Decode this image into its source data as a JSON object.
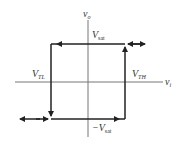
{
  "diagram": {
    "axes": {
      "vertical": {
        "var": "v",
        "sub": "o"
      },
      "horizontal": {
        "var": "v",
        "sub": "i"
      }
    },
    "labels": {
      "vsat_pos": {
        "prefix": "",
        "var": "V",
        "sub": "sat"
      },
      "vsat_neg": {
        "prefix": "−",
        "var": "V",
        "sub": "sat"
      },
      "vtl": {
        "var": "V",
        "sub": "TL"
      },
      "vth": {
        "var": "V",
        "sub": "TH"
      }
    },
    "colors": {
      "line": "#222222",
      "axis": "#777777",
      "text": "#333333"
    }
  }
}
